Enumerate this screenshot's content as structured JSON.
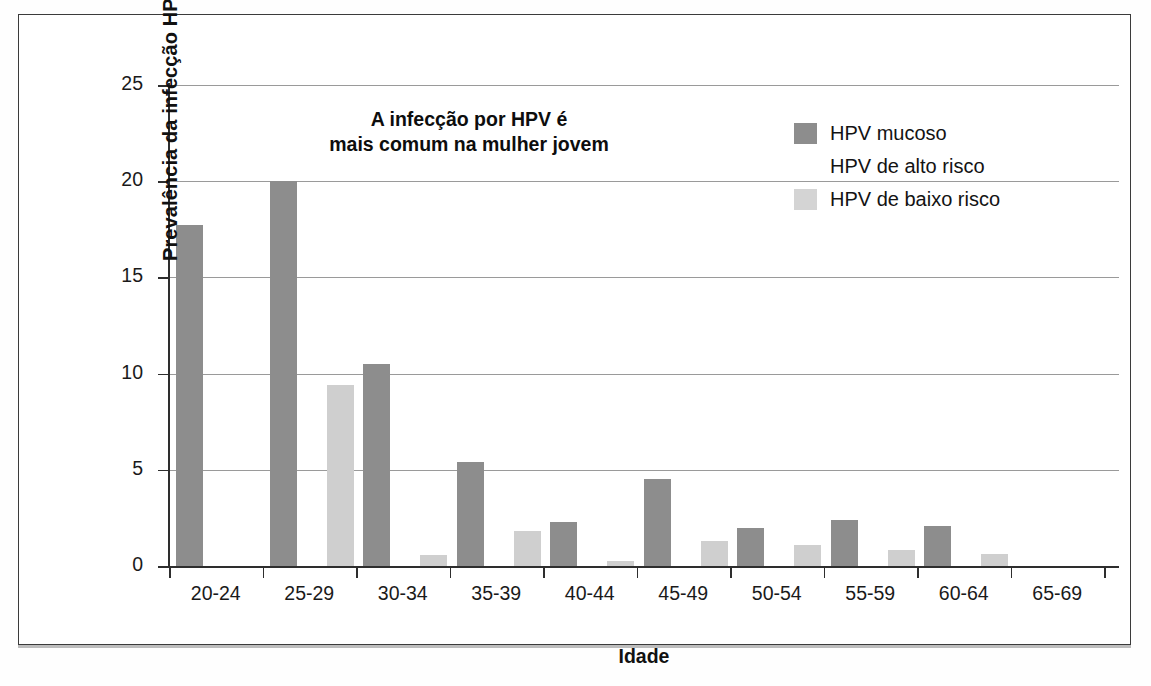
{
  "chart_data": {
    "type": "bar",
    "title": "",
    "annotation": [
      "A infecção por HPV é",
      "mais comum na mulher jovem"
    ],
    "xlabel": "Idade",
    "ylabel": "Prevalência da infecção HPV (%)",
    "ylim": [
      0,
      25
    ],
    "yticks": [
      0,
      5,
      10,
      15,
      20,
      25
    ],
    "ytick_labels": [
      "0",
      "5",
      "10",
      "15",
      "20",
      "25"
    ],
    "grid": true,
    "legend_position": "top-right",
    "categories": [
      "20-24",
      "25-29",
      "30-34",
      "35-39",
      "40-44",
      "45-49",
      "50-54",
      "55-59",
      "60-64",
      "65-69"
    ],
    "series": [
      {
        "name": "HPV mucoso",
        "color": "#8d8d8d",
        "values": [
          17.7,
          20.0,
          10.5,
          5.4,
          2.3,
          4.5,
          2.0,
          2.4,
          2.1,
          0.0
        ]
      },
      {
        "name": "HPV de alto risco",
        "color": "#ffffff",
        "values": [
          0.0,
          0.0,
          0.0,
          0.0,
          0.0,
          0.0,
          0.0,
          0.0,
          0.0,
          0.0
        ]
      },
      {
        "name": "HPV de baixo risco",
        "color": "#d0d0d0",
        "values": [
          0.0,
          9.4,
          0.55,
          1.8,
          0.25,
          1.3,
          1.1,
          0.85,
          0.65,
          0.0
        ]
      }
    ]
  },
  "legend": {
    "items": [
      {
        "label": "HPV mucoso",
        "swatch": "mucoso"
      },
      {
        "label": "HPV de alto risco",
        "swatch": "alto"
      },
      {
        "label": "HPV de baixo risco",
        "swatch": "baixo"
      }
    ]
  }
}
